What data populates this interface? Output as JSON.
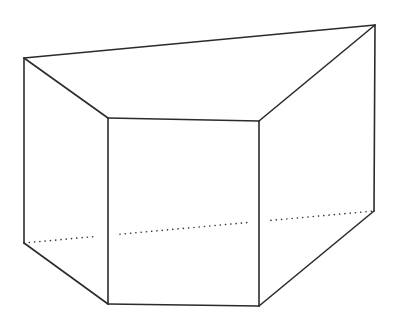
{
  "diagram": {
    "type": "prism",
    "colors": {
      "line": "#2b2b2b",
      "background": "#ffffff"
    },
    "vertices": {
      "top_back_left": [
        24,
        58
      ],
      "top_back_right": [
        375,
        25
      ],
      "top_front_left": [
        108,
        118
      ],
      "top_front_right": [
        259,
        121
      ],
      "bottom_back_left": [
        24,
        243
      ],
      "bottom_back_right": [
        374,
        211
      ],
      "bottom_front_left": [
        108,
        304
      ],
      "bottom_front_right": [
        259,
        306
      ]
    },
    "visible_edges": [
      [
        "top_back_left",
        "top_back_right"
      ],
      [
        "top_back_left",
        "top_front_left"
      ],
      [
        "top_front_left",
        "top_front_right"
      ],
      [
        "top_front_right",
        "top_back_right"
      ],
      [
        "top_back_left",
        "bottom_back_left"
      ],
      [
        "top_front_left",
        "bottom_front_left"
      ],
      [
        "top_front_right",
        "bottom_front_right"
      ],
      [
        "top_back_right",
        "bottom_back_right"
      ],
      [
        "bottom_back_left",
        "bottom_front_left"
      ],
      [
        "bottom_front_left",
        "bottom_front_right"
      ],
      [
        "bottom_front_right",
        "bottom_back_right"
      ]
    ],
    "hidden_edges": [
      [
        "bottom_back_left",
        "bottom_back_right"
      ]
    ],
    "labels": []
  }
}
